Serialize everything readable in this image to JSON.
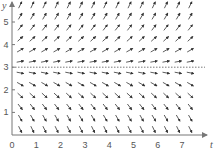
{
  "chart_data": {
    "type": "slope_field",
    "title": "",
    "xlabel": "t",
    "ylabel": "y",
    "x_ticks": [
      0,
      1,
      2,
      3,
      4,
      5,
      6,
      7
    ],
    "y_ticks": [
      1,
      2,
      3,
      4,
      5
    ],
    "xlim": [
      0,
      8
    ],
    "ylim": [
      0,
      5.8
    ],
    "equilibrium": {
      "y": 3,
      "style": "dotted"
    },
    "field": {
      "description": "dy/dt proportional to (y - 3): arrows point up-right above y=3 and down-right below y=3, steeper farther from 3",
      "t_step": 0.5,
      "y_step": 0.5,
      "k": 0.8
    },
    "grid": false,
    "colors": {
      "axis": "#777777",
      "arrow": "#333333",
      "equilibrium": "#555555"
    }
  },
  "layout": {
    "origin_px": [
      12,
      135
    ],
    "px_per_t": 24.3,
    "px_per_y": 22.6
  }
}
